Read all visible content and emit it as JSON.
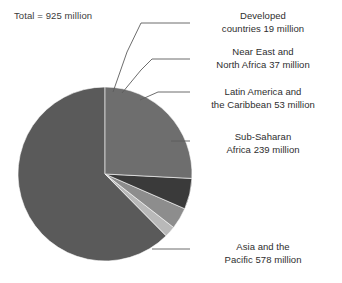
{
  "chart_data": {
    "type": "pie",
    "title": "",
    "subtitle": "",
    "xlabel": "",
    "ylabel": "",
    "total_label": "Total = 925 million",
    "total_value": 925,
    "units": "million",
    "legend_position": "callout-labels-right",
    "grid": false,
    "categories": [
      "Asia and the Pacific",
      "Developed countries",
      "Near East and North Africa",
      "Latin America and the Caribbean",
      "Sub-Saharan Africa"
    ],
    "values": [
      578,
      19,
      37,
      53,
      239
    ],
    "labels": [
      "Asia and the\nPacific 578 million",
      "Developed\ncountries 19 million",
      "Near East and\nNorth Africa 37 million",
      "Latin America and\nthe Caribbean 53 million",
      "Sub-Saharan\nAfrica 239 million"
    ],
    "colors": [
      "#5a5a5a",
      "#b9b9b9",
      "#8d8d8d",
      "#3a3a3a",
      "#6e6e6e"
    ],
    "start_angle_deg": -90,
    "direction": "clockwise"
  },
  "slices": {
    "asia": {
      "name": "Asia and the Pacific",
      "value": 578,
      "value_text": "578 million",
      "color": "#5a5a5a"
    },
    "developed": {
      "name": "Developed countries",
      "value": 19,
      "value_text": "19 million",
      "color": "#b9b9b9"
    },
    "neareast": {
      "name": "Near East and North Africa",
      "value": 37,
      "value_text": "37 million",
      "color": "#8d8d8d"
    },
    "latin": {
      "name": "Latin America and the Caribbean",
      "value": 53,
      "value_text": "53 million",
      "color": "#3a3a3a"
    },
    "subsaharan": {
      "name": "Sub-Saharan Africa",
      "value": 239,
      "value_text": "239 million",
      "color": "#6e6e6e"
    }
  },
  "annotations": {
    "total": "Total = 925 million"
  },
  "callouts": {
    "developed": "Developed\ncountries 19 million",
    "neareast": "Near East and\nNorth Africa 37 million",
    "latin": "Latin America and\nthe Caribbean 53 million",
    "subsaharan": "Sub-Saharan\nAfrica 239 million",
    "asia": "Asia and the\nPacific 578 million"
  },
  "style": {
    "background": "#ffffff",
    "text_color": "#2e2e2e",
    "leader_color": "#5c5c5c"
  }
}
